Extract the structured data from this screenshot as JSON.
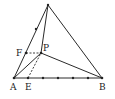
{
  "diagram": {
    "type": "geometry",
    "points": {
      "apex": {
        "label": "",
        "x": 48,
        "y": 5
      },
      "A": {
        "label": "A",
        "x": 14,
        "y": 78
      },
      "B": {
        "label": "B",
        "x": 102,
        "y": 78
      },
      "P": {
        "label": "P",
        "x": 41,
        "y": 53
      },
      "F": {
        "label": "F",
        "x": 26,
        "y": 53
      },
      "E": {
        "label": "E",
        "x": 28,
        "y": 78
      }
    },
    "labels": {
      "A": "A",
      "B": "B",
      "E": "E",
      "F": "F",
      "P": "P"
    },
    "segments_solid": [
      "apex-A",
      "apex-B",
      "apex-P",
      "A-B",
      "A-P",
      "P-B"
    ],
    "segments_dashed": [
      "F-P",
      "E-P"
    ],
    "tick_points_on_AB": [
      28,
      43,
      58,
      73,
      88
    ],
    "tick_point_on_apexA": {
      "x": 36,
      "y": 29
    }
  }
}
